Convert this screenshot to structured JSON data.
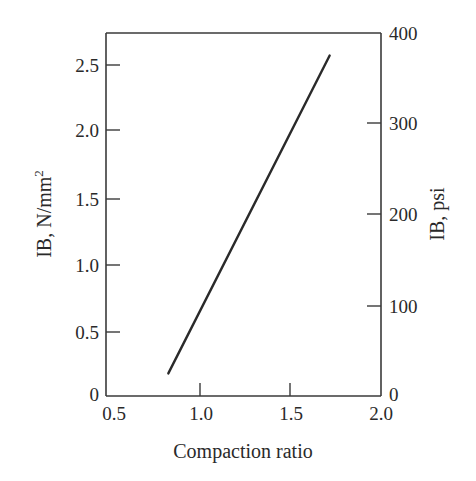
{
  "chart_data": {
    "type": "line",
    "title": "",
    "xlabel": "Compaction ratio",
    "ylabel": "IB, N/mm²",
    "ylabel_base": "IB, N/mm",
    "ylabel_sup": "2",
    "y2label": "IB, psi",
    "xlim": [
      0.5,
      2.0
    ],
    "ylim": [
      0,
      2.74
    ],
    "y2lim": [
      0,
      400
    ],
    "xticks": [
      0.5,
      1.0,
      1.5,
      2.0
    ],
    "xtick_labels": [
      "0.5",
      "1.0",
      "1.5",
      "2.0"
    ],
    "yticks": [
      0,
      0.5,
      1.0,
      1.5,
      2.0,
      2.5
    ],
    "ytick_labels": [
      "0",
      "0.5",
      "1.0",
      "1.5",
      "2.0",
      "2.5"
    ],
    "y2ticks": [
      0,
      100,
      200,
      300,
      400
    ],
    "y2tick_labels": [
      "0",
      "100",
      "200",
      "300",
      "400"
    ],
    "grid": false,
    "legend": null,
    "series": [
      {
        "name": "IB vs compaction ratio",
        "x": [
          0.84,
          1.72
        ],
        "y": [
          0.17,
          2.56
        ]
      }
    ]
  }
}
